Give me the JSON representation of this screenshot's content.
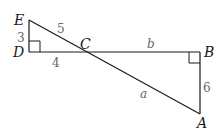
{
  "diagram": {
    "title": "",
    "vertices": {
      "E": "E",
      "D": "D",
      "C": "C",
      "B": "B",
      "A": "A"
    },
    "side_labels": {
      "ED": "3",
      "EC": "5",
      "DC": "4",
      "CB": "b",
      "BA": "6",
      "CA": "a"
    },
    "colors": {
      "line": "#1a1a1a",
      "label": "#666666"
    }
  }
}
